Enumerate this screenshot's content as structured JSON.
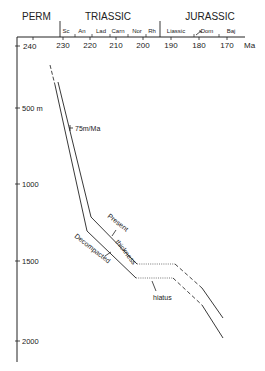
{
  "diagram": {
    "type": "burial-history-curve",
    "periods": [
      {
        "label": "PERM",
        "x": 22
      },
      {
        "label": "TRIASSIC",
        "x": 108
      },
      {
        "label": "JURASSIC",
        "x": 210
      }
    ],
    "stages": [
      {
        "label": "Sc",
        "x": 63
      },
      {
        "label": "An",
        "x": 80
      },
      {
        "label": "Lad",
        "x": 99
      },
      {
        "label": "Carn",
        "x": 117
      },
      {
        "label": "Nor",
        "x": 135
      },
      {
        "label": "Rh",
        "x": 151
      },
      {
        "label": "Liassic",
        "x": 170
      },
      {
        "label": "Dom",
        "x": 200
      },
      {
        "label": "Baj",
        "x": 227
      }
    ],
    "time_axis": {
      "unit_label": "Ma",
      "ticks": [
        {
          "label": "240",
          "x": 23
        },
        {
          "label": "230",
          "x": 63
        },
        {
          "label": "220",
          "x": 90
        },
        {
          "label": "210",
          "x": 116
        },
        {
          "label": "200",
          "x": 143
        },
        {
          "label": "190",
          "x": 171
        },
        {
          "label": "180",
          "x": 199
        },
        {
          "label": "170",
          "x": 227
        }
      ]
    },
    "depth_axis": {
      "ticks": [
        {
          "label": "500 m",
          "y": 108
        },
        {
          "label": "1000",
          "y": 184
        },
        {
          "label": "1500",
          "y": 261
        },
        {
          "label": "2000",
          "y": 341
        }
      ]
    },
    "annotations": {
      "rate": "75m/Ma",
      "present": "Present",
      "thickness": "thickness",
      "decompacted": "Decompacted",
      "hiatus": "hiatus"
    },
    "curves": [
      {
        "name": "Present",
        "points": "58,82 91,217 137,264"
      },
      {
        "name": "Decompacted",
        "points": "55,85 87,231 136,278"
      }
    ]
  }
}
